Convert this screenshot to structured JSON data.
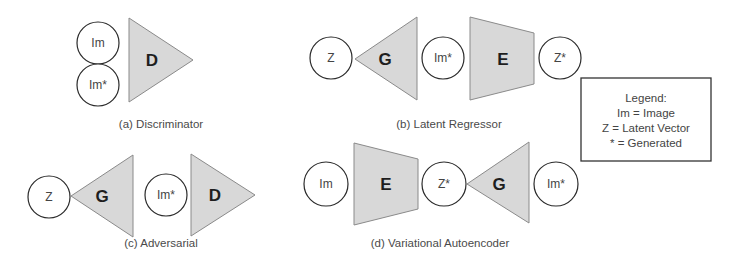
{
  "panels": {
    "a": {
      "caption": "(a) Discriminator",
      "nodes": {
        "im": "Im",
        "im_gen": "Im*"
      },
      "blocks": {
        "d": "D"
      }
    },
    "b": {
      "caption": "(b) Latent Regressor",
      "nodes": {
        "z": "Z",
        "im_gen": "Im*",
        "z_gen": "Z*"
      },
      "blocks": {
        "g": "G",
        "e": "E"
      }
    },
    "c": {
      "caption": "(c) Adversarial",
      "nodes": {
        "z": "Z",
        "im_gen": "Im*"
      },
      "blocks": {
        "g": "G",
        "d": "D"
      }
    },
    "d": {
      "caption": "(d) Variational Autoencoder",
      "nodes": {
        "im": "Im",
        "z_gen": "Z*",
        "im_gen": "Im*"
      },
      "blocks": {
        "e": "E",
        "g": "G"
      }
    }
  },
  "legend": {
    "title": "Legend:",
    "lines": [
      "Im = Image",
      "Z = Latent Vector",
      "* = Generated"
    ]
  },
  "colors": {
    "block_fill": "#d8d8d8",
    "block_stroke": "#8a8a8a",
    "circle_stroke": "#2a2a2a"
  }
}
